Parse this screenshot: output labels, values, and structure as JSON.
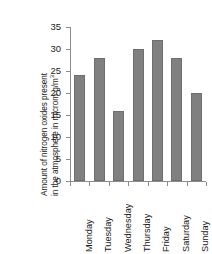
{
  "chart_data": {
    "type": "bar",
    "title": "",
    "xlabel": "",
    "ylabel_line1": "Amount of nitrogen oxides present",
    "ylabel_line2": "in the atmosphere in microm g/m",
    "ylabel_exponent": "3",
    "categories": [
      "Monday",
      "Tuesday",
      "Wednesday",
      "Thursday",
      "Friday",
      "Saturday",
      "Sunday"
    ],
    "values": [
      24,
      28,
      16,
      30,
      32,
      28,
      20
    ],
    "ylim": [
      0,
      35
    ],
    "yticks": [
      0,
      5,
      10,
      15,
      20,
      25,
      30,
      35
    ],
    "ytick_labels": [
      "0",
      "5",
      "10",
      "15",
      "20",
      "25",
      "30",
      "35"
    ],
    "grid": false,
    "legend": null,
    "bar_color": "#808080",
    "bar_edge_color": "#6e6e6e",
    "axis_color": "#8c8c8c",
    "background_color": "#ffffff"
  }
}
